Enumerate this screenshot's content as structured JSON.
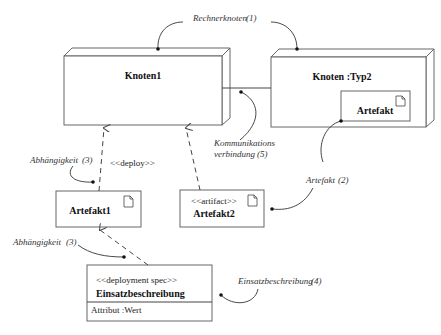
{
  "diagram": {
    "type": "UML deployment diagram",
    "nodes": [
      {
        "id": "knoten1",
        "label": "Knoten1"
      },
      {
        "id": "knoten-typ2",
        "label": "Knoten :Typ2",
        "artifact": {
          "label": "Artefakt"
        }
      }
    ],
    "artifacts": [
      {
        "id": "artefakt1",
        "label": "Artefakt1",
        "stereotype": ""
      },
      {
        "id": "artefakt2",
        "label": "Artefakt2",
        "stereotype": "<<artifact>>"
      }
    ],
    "deployment_spec": {
      "stereotype": "<<deployment spec>>",
      "label": "Einsatzbeschreibung",
      "attribute": "Attribut :Wert"
    },
    "relations": {
      "deploy_label": "<<deploy>>"
    },
    "annotations": {
      "rechnerknoten": "Rechnerknoten",
      "rechnerknoten_num": "(1)",
      "artefakt": "Artefakt",
      "artefakt_num": "(2)",
      "abhaengigkeit_top": "Abhängigkeit",
      "abhaengigkeit_top_num": "(3)",
      "abhaengigkeit_bottom": "Abhängigkeit",
      "abhaengigkeit_bottom_num": "(3)",
      "einsatzbeschreibung": "Einsatzbeschreibung",
      "einsatzbeschreibung_num": "(4)",
      "kommunikation_line1": "Kommunikations",
      "kommunikation_line2": "verbindung",
      "kommunikation_num": "(5)"
    }
  }
}
